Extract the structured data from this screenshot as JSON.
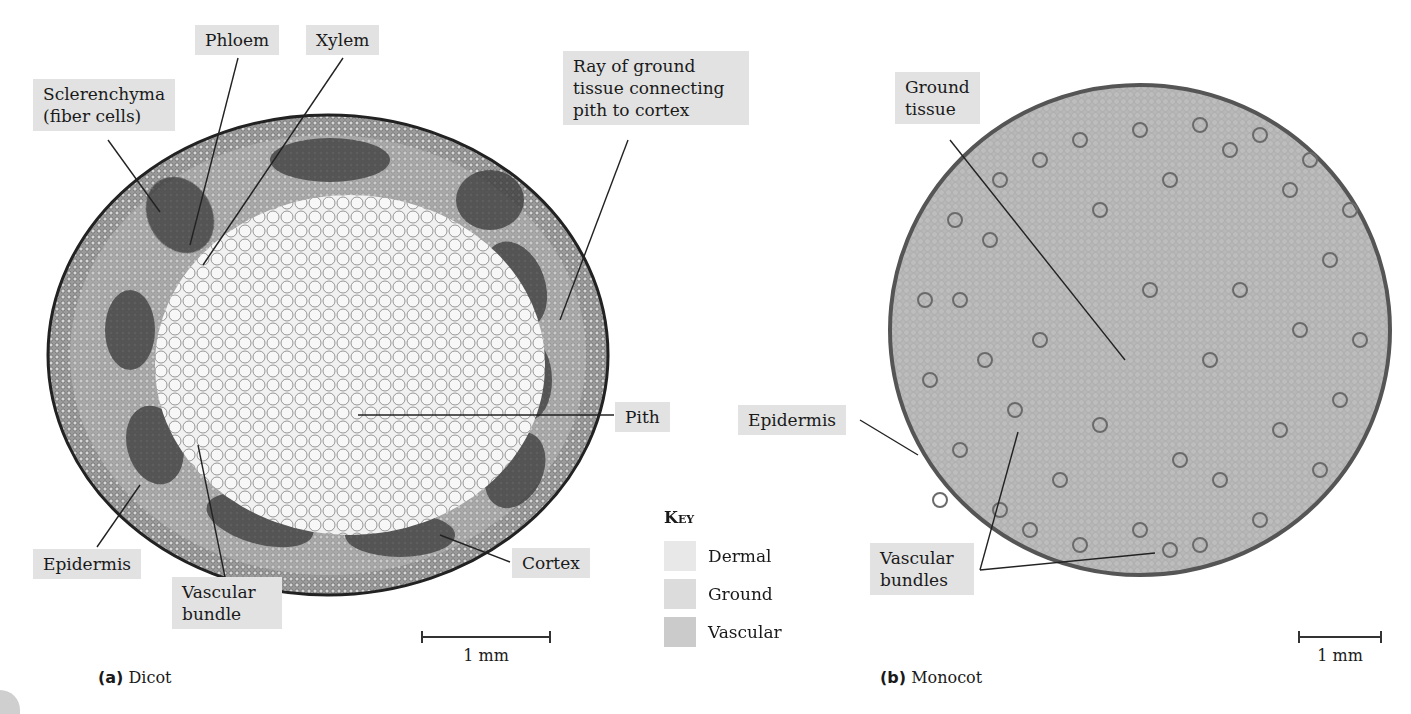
{
  "dicot": {
    "caption_letter": "(a)",
    "caption_text": "Dicot",
    "scale_label": "1 mm",
    "labels": {
      "phloem": "Phloem",
      "xylem": "Xylem",
      "sclerenchyma": "Sclerenchyma\n(fiber cells)",
      "ray": "Ray of ground\ntissue connecting\npith to cortex",
      "pith": "Pith",
      "epidermis": "Epidermis",
      "vascular_bundle": "Vascular\nbundle",
      "cortex": "Cortex"
    }
  },
  "monocot": {
    "caption_letter": "(b)",
    "caption_text": "Monocot",
    "scale_label": "1 mm",
    "labels": {
      "ground_tissue": "Ground\ntissue",
      "epidermis": "Epidermis",
      "vascular_bundles": "Vascular\nbundles"
    }
  },
  "key": {
    "title": "Key",
    "items": [
      {
        "label": "Dermal",
        "color": "#e8e8e8"
      },
      {
        "label": "Ground",
        "color": "#dcdcdc"
      },
      {
        "label": "Vascular",
        "color": "#cbcbcb"
      }
    ]
  }
}
